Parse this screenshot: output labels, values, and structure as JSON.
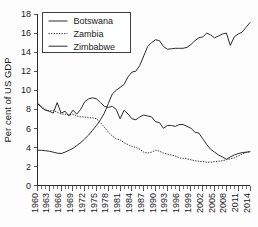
{
  "chart_data": {
    "type": "line",
    "title": "",
    "subtitle": "",
    "xlabel": "",
    "ylabel": "Per cent of US GDP",
    "ylim": [
      0,
      18
    ],
    "xlim": [
      1960,
      2014
    ],
    "ytick_step": 2,
    "xtick_label_step": 3,
    "grid": false,
    "legend_position": "top-left",
    "yticks": [
      "0",
      "2",
      "4",
      "6",
      "8",
      "10",
      "12",
      "14",
      "16",
      "18"
    ],
    "xticks": [
      "1960",
      "1963",
      "1966",
      "1969",
      "1972",
      "1975",
      "1978",
      "1981",
      "1984",
      "1987",
      "1990",
      "1993",
      "1996",
      "1999",
      "2002",
      "2005",
      "2008",
      "2011",
      "2014"
    ],
    "x": [
      1960,
      1961,
      1962,
      1963,
      1964,
      1965,
      1966,
      1967,
      1968,
      1969,
      1970,
      1971,
      1972,
      1973,
      1974,
      1975,
      1976,
      1977,
      1978,
      1979,
      1980,
      1981,
      1982,
      1983,
      1984,
      1985,
      1986,
      1987,
      1988,
      1989,
      1990,
      1991,
      1992,
      1993,
      1994,
      1995,
      1996,
      1997,
      1998,
      1999,
      2000,
      2001,
      2002,
      2003,
      2004,
      2005,
      2006,
      2007,
      2008,
      2009,
      2010,
      2011,
      2012,
      2013,
      2014
    ],
    "series": [
      {
        "name": "Botswana",
        "style": "solid",
        "color": "#2c2c2c",
        "values": [
          3.7,
          3.7,
          3.65,
          3.6,
          3.5,
          3.4,
          3.35,
          3.5,
          3.7,
          3.9,
          4.2,
          4.5,
          4.9,
          5.3,
          5.8,
          6.3,
          6.9,
          7.6,
          8.6,
          9.6,
          10.0,
          10.3,
          10.6,
          11.4,
          11.9,
          12.0,
          12.6,
          13.6,
          14.6,
          15.0,
          15.3,
          15.2,
          14.6,
          14.3,
          14.35,
          14.4,
          14.4,
          14.4,
          14.5,
          14.8,
          15.2,
          15.5,
          15.6,
          16.0,
          15.8,
          15.5,
          15.7,
          15.9,
          16.0,
          14.7,
          15.6,
          15.9,
          16.1,
          16.6,
          17.1
        ]
      },
      {
        "name": "Zambia",
        "style": "dotted",
        "color": "#2c2c2c",
        "values": [
          8.7,
          8.3,
          8.0,
          7.8,
          7.9,
          7.7,
          7.5,
          7.5,
          7.4,
          7.5,
          7.3,
          7.2,
          7.2,
          7.1,
          7.1,
          7.0,
          6.6,
          6.1,
          5.6,
          5.2,
          4.9,
          4.8,
          4.5,
          4.3,
          4.1,
          4.0,
          3.8,
          3.5,
          3.4,
          3.5,
          3.7,
          3.6,
          3.4,
          3.3,
          3.2,
          3.1,
          2.9,
          2.85,
          2.8,
          2.7,
          2.6,
          2.55,
          2.5,
          2.45,
          2.45,
          2.5,
          2.55,
          2.6,
          2.7,
          2.8,
          2.9,
          3.1,
          3.3,
          3.45,
          3.55
        ]
      },
      {
        "name": "Zimbabwe",
        "style": "solid",
        "color": "#2c2c2c",
        "values": [
          8.6,
          8.2,
          7.9,
          7.8,
          7.6,
          8.7,
          7.6,
          7.8,
          7.3,
          7.9,
          7.5,
          8.0,
          8.8,
          9.1,
          9.2,
          9.1,
          8.7,
          8.3,
          8.2,
          8.3,
          8.0,
          7.0,
          7.9,
          7.5,
          7.0,
          6.9,
          7.2,
          7.4,
          7.3,
          7.2,
          6.7,
          6.6,
          6.0,
          6.3,
          6.3,
          6.2,
          6.4,
          6.4,
          6.2,
          6.0,
          5.6,
          5.5,
          4.9,
          4.3,
          3.8,
          3.5,
          3.2,
          3.0,
          2.75,
          3.0,
          3.2,
          3.35,
          3.45,
          3.5,
          3.55
        ]
      }
    ]
  },
  "legend": {
    "items": [
      {
        "label": "Botswana",
        "style": "solid"
      },
      {
        "label": "Zambia",
        "style": "dotted"
      },
      {
        "label": "Zimbabwe",
        "style": "solid"
      }
    ]
  }
}
